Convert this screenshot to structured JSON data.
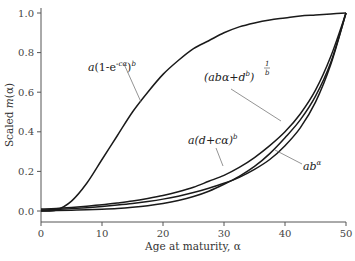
{
  "chart_data": {
    "type": "line",
    "title": "",
    "xlabel": "Age at maturity, α",
    "ylabel": "Scaled m(α)",
    "xlim": [
      0,
      50
    ],
    "ylim": [
      0,
      1.0
    ],
    "x_ticks": [
      "0",
      "10",
      "20",
      "30",
      "40",
      "50"
    ],
    "y_ticks": [
      "0.0",
      "0.2",
      "0.4",
      "0.6",
      "0.8",
      "1.0"
    ],
    "grid": false,
    "legend": "inline annotations",
    "x": [
      0,
      2.5,
      5,
      7.5,
      10,
      12.5,
      15,
      17.5,
      20,
      22.5,
      25,
      27.5,
      30,
      32.5,
      35,
      37.5,
      40,
      42.5,
      45,
      47.5,
      50
    ],
    "series": [
      {
        "name": "a(1-e^{-cα})^b",
        "values": [
          0.0,
          0.005,
          0.05,
          0.14,
          0.26,
          0.38,
          0.5,
          0.6,
          0.69,
          0.76,
          0.82,
          0.86,
          0.9,
          0.93,
          0.95,
          0.965,
          0.975,
          0.985,
          0.99,
          0.995,
          1.0
        ]
      },
      {
        "name": "(abα+d^b)^{1/b}",
        "values": [
          0.01,
          0.013,
          0.018,
          0.024,
          0.031,
          0.04,
          0.05,
          0.063,
          0.078,
          0.097,
          0.12,
          0.15,
          0.18,
          0.22,
          0.27,
          0.33,
          0.4,
          0.49,
          0.61,
          0.78,
          1.0
        ]
      },
      {
        "name": "a(d+cα)^b",
        "values": [
          0.005,
          0.008,
          0.012,
          0.017,
          0.023,
          0.03,
          0.038,
          0.048,
          0.06,
          0.075,
          0.093,
          0.115,
          0.14,
          0.17,
          0.21,
          0.26,
          0.33,
          0.42,
          0.55,
          0.74,
          1.0
        ]
      },
      {
        "name": "ab^α",
        "values": [
          0.0,
          0.002,
          0.004,
          0.006,
          0.009,
          0.013,
          0.019,
          0.027,
          0.038,
          0.053,
          0.073,
          0.1,
          0.135,
          0.175,
          0.225,
          0.29,
          0.37,
          0.46,
          0.58,
          0.75,
          1.0
        ]
      }
    ],
    "annotations": [
      {
        "text": "a(1-e^{-cα})^b",
        "target_series": 0
      },
      {
        "text": "(abα+d^b)^{1/b}",
        "target_series": 1
      },
      {
        "text": "a(d+cα)^b",
        "target_series": 2
      },
      {
        "text": "ab^α",
        "target_series": 3
      }
    ]
  },
  "labels": {
    "xlabel": "Age at maturity, α",
    "ylabel_prefix": "Scaled ",
    "ylabel_func": "m",
    "ylabel_arg": "(α)",
    "eq1_base": "a",
    "eq1_body": "(1-e",
    "eq1_exp": "-cα",
    "eq1_close": ")",
    "eq1_pow": "b",
    "eq2_body": "(abα+d",
    "eq2_exp": "b",
    "eq2_close": ")",
    "eq2_pow_num": "1",
    "eq2_pow_den": "b",
    "eq3_body": "a(d+cα)",
    "eq3_pow": "b",
    "eq4_body": "ab",
    "eq4_pow": "α"
  }
}
